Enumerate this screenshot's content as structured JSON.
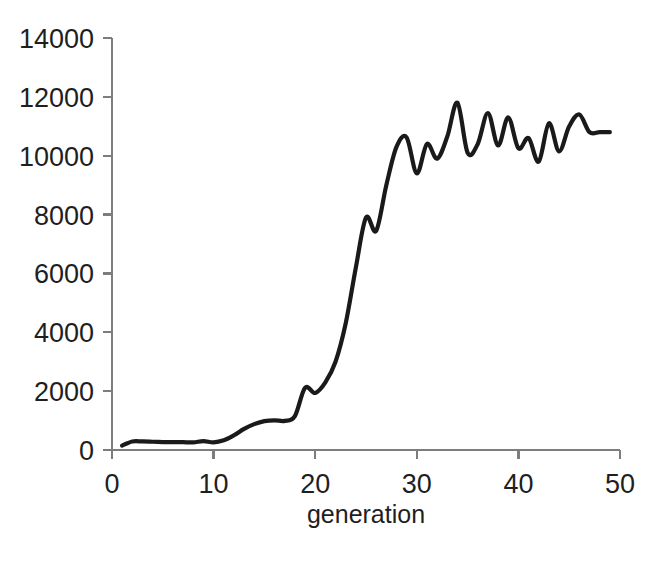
{
  "chart_data": {
    "type": "line",
    "title": "",
    "subtitle": "",
    "xlabel": "generation",
    "ylabel": "",
    "xlim": [
      0,
      50
    ],
    "ylim": [
      0,
      14000
    ],
    "grid": false,
    "legend": null,
    "x_ticks": [
      "0",
      "10",
      "20",
      "30",
      "40",
      "50"
    ],
    "x_tick_values": [
      0,
      10,
      20,
      30,
      40,
      50
    ],
    "y_ticks": [
      "0",
      "2000",
      "4000",
      "6000",
      "8000",
      "10000",
      "12000",
      "14000"
    ],
    "y_tick_values": [
      0,
      2000,
      4000,
      6000,
      8000,
      10000,
      12000,
      14000
    ],
    "line_color": "#1a1a1a",
    "axis_color": "#7d7d7d",
    "background_color": "#ffffff",
    "series": [
      {
        "name": "fitness",
        "x": [
          1,
          2,
          3,
          4,
          5,
          6,
          7,
          8,
          9,
          10,
          11,
          12,
          13,
          14,
          15,
          16,
          17,
          18,
          19,
          20,
          21,
          22,
          23,
          24,
          25,
          26,
          27,
          28,
          29,
          30,
          31,
          32,
          33,
          34,
          35,
          36,
          37,
          38,
          39,
          40,
          41,
          42,
          43,
          44,
          45,
          46,
          47,
          48,
          49
        ],
        "values": [
          150,
          290,
          290,
          280,
          270,
          265,
          265,
          260,
          300,
          260,
          330,
          500,
          720,
          880,
          980,
          1010,
          990,
          1150,
          2110,
          1940,
          2300,
          3000,
          4300,
          6200,
          7900,
          7450,
          9000,
          10300,
          10620,
          9400,
          10400,
          9900,
          10650,
          11800,
          10100,
          10400,
          11450,
          10350,
          11300,
          10250,
          10600,
          9800,
          11100,
          10150,
          11000,
          11400,
          10800,
          10800,
          10800
        ]
      }
    ]
  },
  "labels": {
    "y_axis_top": "14000",
    "x_axis_title": "generation"
  }
}
